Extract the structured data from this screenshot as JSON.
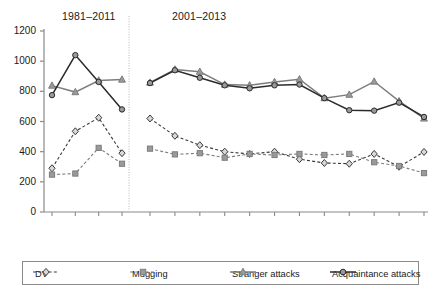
{
  "chart_data": {
    "type": "line",
    "title": "",
    "xlabel": "",
    "ylabel": "",
    "ylim": [
      0,
      1200
    ],
    "yticks": [
      0,
      200,
      400,
      600,
      800,
      1000,
      1200
    ],
    "grid": false,
    "legend_position": "bottom",
    "panels": [
      {
        "title": "1981–2011",
        "categories": [
          "1981",
          "1991",
          "2001",
          "2011"
        ],
        "series": [
          {
            "name": "DV",
            "marker": "diamond",
            "line": "dashed",
            "values": [
              290,
              535,
              625,
              390
            ]
          },
          {
            "name": "Mugging",
            "marker": "square",
            "line": "dashed",
            "values": [
              248,
              255,
              425,
              320
            ]
          },
          {
            "name": "Stranger attacks",
            "marker": "triangle",
            "line": "solid",
            "values": [
              838,
              795,
              872,
              878
            ]
          },
          {
            "name": "Acquaintance attacks",
            "marker": "circle",
            "line": "solid",
            "values": [
              775,
              1040,
              862,
              680
            ]
          }
        ]
      },
      {
        "title": "2001–2013",
        "categories": [
          "2001/2",
          "2002/3",
          "2003/4",
          "2004/5",
          "2005/6",
          "2006/7",
          "2007/8",
          "2008/9",
          "2009/10",
          "2010/11",
          "2011/12",
          "2012/13"
        ],
        "series": [
          {
            "name": "DV",
            "marker": "diamond",
            "line": "dashed",
            "values": [
              620,
              505,
              443,
              400,
              385,
              400,
              350,
              325,
              320,
              385,
              300,
              398
            ]
          },
          {
            "name": "Mugging",
            "marker": "square",
            "line": "dashed",
            "values": [
              420,
              382,
              390,
              360,
              385,
              378,
              385,
              378,
              385,
              330,
              305,
              258
            ]
          },
          {
            "name": "Stranger attacks",
            "marker": "triangle",
            "line": "solid",
            "values": [
              858,
              945,
              930,
              845,
              840,
              862,
              880,
              755,
              778,
              865,
              735,
              620
            ]
          },
          {
            "name": "Acquaintance attacks",
            "marker": "circle",
            "line": "solid",
            "values": [
              855,
              940,
              890,
              840,
              820,
              840,
              845,
              755,
              675,
              672,
              725,
              630
            ]
          }
        ]
      }
    ],
    "legend": [
      {
        "label": "DV",
        "marker": "diamond",
        "line": "dashed"
      },
      {
        "label": "Mugging",
        "marker": "square",
        "line": "dashed"
      },
      {
        "label": "Stranger attacks",
        "marker": "triangle",
        "line": "solid"
      },
      {
        "label": "Acquaintance attacks",
        "marker": "circle",
        "line": "solid"
      }
    ],
    "colors": {
      "axis": "#8a8a8a",
      "dv": "#3a3a3a",
      "mugging": "#7d7d7d",
      "stranger": "#7d7d7d",
      "acquaintance": "#2b2b2b",
      "marker_fill": "#9a9a9a",
      "background": "#ffffff"
    }
  }
}
